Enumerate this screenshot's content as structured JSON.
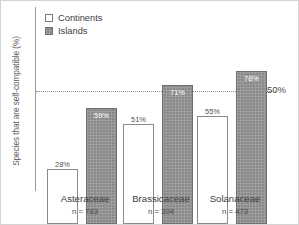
{
  "chart_data": {
    "type": "bar",
    "title": "",
    "xlabel": "",
    "ylabel": "Species that are self-compatible (%)",
    "ylim": [
      0,
      93
    ],
    "grid": false,
    "legend_position": "top-left",
    "categories": [
      "Asteraceae",
      "Brassicaceae",
      "Solanaceae"
    ],
    "sample_sizes": [
      "n = 783",
      "n = 304",
      "n = 473"
    ],
    "series": [
      {
        "name": "Continents",
        "values": [
          28,
          51,
          55
        ],
        "labels": [
          "28%",
          "51%",
          "55%"
        ],
        "color": "#ffffff",
        "border_color": "#8a8a8a"
      },
      {
        "name": "Islands",
        "values": [
          59,
          71,
          78
        ],
        "labels": [
          "59%",
          "71%",
          "78%"
        ],
        "color": "#8a8a8a",
        "border_color": "#6f6f6f"
      }
    ],
    "annotations": [
      {
        "name": "reference-line",
        "value": 50,
        "label": "50%",
        "style": "dotted"
      }
    ]
  },
  "legend": {
    "items": [
      {
        "label": "Continents"
      },
      {
        "label": "Islands"
      }
    ]
  }
}
